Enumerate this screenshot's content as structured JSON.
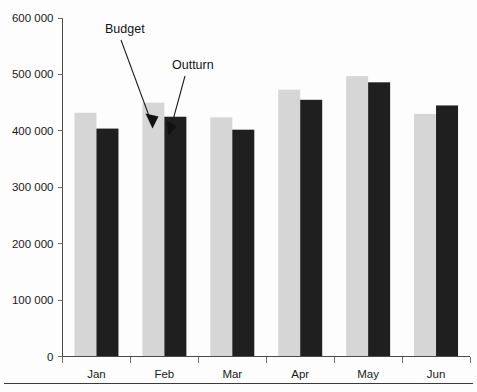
{
  "chart_data": {
    "type": "bar",
    "title": "",
    "subtitle": "",
    "xlabel": "",
    "ylabel": "",
    "categories": [
      "Jan",
      "Feb",
      "Mar",
      "Apr",
      "May",
      "Jun"
    ],
    "series": [
      {
        "name": "Budget",
        "color": "#d6d6d6",
        "values": [
          432000,
          450000,
          424000,
          473000,
          497000,
          430000
        ]
      },
      {
        "name": "Outturn",
        "color": "#1f1f1f",
        "values": [
          404000,
          425000,
          402000,
          455000,
          486000,
          445000
        ]
      }
    ],
    "ylim": [
      0,
      600000
    ],
    "ytick_values": [
      0,
      100000,
      200000,
      300000,
      400000,
      500000,
      600000
    ],
    "ytick_labels": [
      "0",
      "100 000",
      "200 000",
      "300 000",
      "400 000",
      "500 000",
      "600 000"
    ],
    "grid": false,
    "legend_position": "none",
    "annotations": [
      {
        "text": "Budget",
        "target_series": "Budget",
        "target_category": "Feb"
      },
      {
        "text": "Outturn",
        "target_series": "Outturn",
        "target_category": "Feb"
      }
    ]
  },
  "colors": {
    "budget": "#d6d6d6",
    "outturn": "#1f1f1f",
    "axis": "#4a4a4a",
    "text": "#1a1a1a",
    "background": "#fdfdfd"
  }
}
